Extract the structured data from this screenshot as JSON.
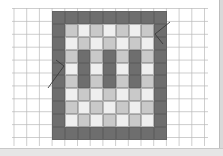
{
  "figure": {
    "grid_paper": {
      "spacing_px": 12.7,
      "line_color": "#b9b9b9",
      "background": "#ffffff"
    },
    "board": {
      "columns": 9,
      "rows": 10,
      "colors": {
        "D": "#6e6e6e",
        "L": "#c9c9c9",
        "W": "#efefef"
      },
      "pattern": [
        [
          "D",
          "D",
          "D",
          "D",
          "D",
          "D",
          "D",
          "D",
          "D"
        ],
        [
          "D",
          "L",
          "W",
          "L",
          "W",
          "L",
          "W",
          "L",
          "D"
        ],
        [
          "D",
          "W",
          "L",
          "W",
          "L",
          "W",
          "L",
          "W",
          "D"
        ],
        [
          "D",
          "L",
          "D",
          "L",
          "D",
          "L",
          "D",
          "L",
          "D"
        ],
        [
          "D",
          "W",
          "D",
          "W",
          "D",
          "W",
          "D",
          "W",
          "D"
        ],
        [
          "D",
          "L",
          "D",
          "L",
          "D",
          "L",
          "D",
          "L",
          "D"
        ],
        [
          "D",
          "W",
          "L",
          "W",
          "L",
          "W",
          "L",
          "W",
          "D"
        ],
        [
          "D",
          "L",
          "W",
          "L",
          "W",
          "L",
          "W",
          "L",
          "D"
        ],
        [
          "D",
          "W",
          "L",
          "W",
          "L",
          "W",
          "L",
          "W",
          "D"
        ],
        [
          "D",
          "D",
          "D",
          "D",
          "D",
          "D",
          "D",
          "D",
          "D"
        ]
      ]
    },
    "annotations": [
      {
        "type": "arrow-line",
        "points": [
          [
            170,
            22
          ],
          [
            155,
            34
          ],
          [
            163,
            44
          ]
        ]
      },
      {
        "type": "arrow-line",
        "points": [
          [
            48,
            88
          ],
          [
            64,
            66
          ],
          [
            56,
            60
          ]
        ]
      }
    ]
  }
}
